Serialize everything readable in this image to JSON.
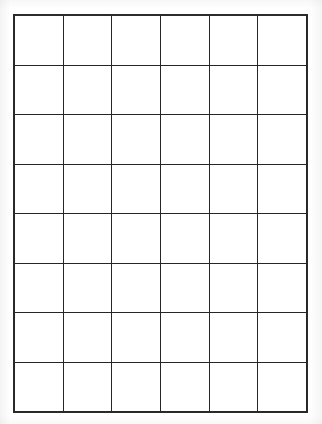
{
  "document": {
    "kind": "blank-grid-worksheet",
    "has_text_content": false,
    "background_color": "#ffffff",
    "line_color": "#262626",
    "line_width_px": 2
  },
  "grid": {
    "columns": 6,
    "rows": 8,
    "total_cells": 48,
    "cell_labels": [
      [
        "",
        "",
        "",
        "",
        "",
        ""
      ],
      [
        "",
        "",
        "",
        "",
        "",
        ""
      ],
      [
        "",
        "",
        "",
        "",
        "",
        ""
      ],
      [
        "",
        "",
        "",
        "",
        "",
        ""
      ],
      [
        "",
        "",
        "",
        "",
        "",
        ""
      ],
      [
        "",
        "",
        "",
        "",
        "",
        ""
      ],
      [
        "",
        "",
        "",
        "",
        "",
        ""
      ],
      [
        "",
        "",
        "",
        "",
        "",
        ""
      ]
    ],
    "bounds_px": {
      "left": 14,
      "top": 15,
      "width": 293,
      "height": 397
    },
    "column_line_x": [
      14,
      63,
      112,
      161,
      209,
      258,
      307
    ],
    "row_line_y": [
      15,
      66,
      116,
      166,
      216,
      265,
      314,
      363,
      412
    ]
  }
}
